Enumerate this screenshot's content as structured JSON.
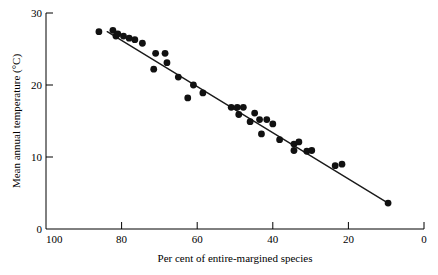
{
  "chart_data": {
    "type": "scatter",
    "title": "",
    "xlabel": "Per cent of entire-margined species",
    "ylabel": "Mean annual temperature (°C)",
    "xlim": [
      100,
      0
    ],
    "ylim": [
      0,
      30
    ],
    "x_reversed": true,
    "grid": false,
    "legend": false,
    "xticks": [
      100,
      80,
      60,
      40,
      20,
      0
    ],
    "xtick_labels": [
      "100",
      "80",
      "60",
      "40",
      "20",
      "0"
    ],
    "yticks": [
      0,
      10,
      20,
      30
    ],
    "ytick_labels": [
      "0",
      "10",
      "20",
      "30"
    ],
    "series": [
      {
        "name": "sites",
        "marker": "filled-circle",
        "color": "#111111",
        "points": [
          [
            86.0,
            27.4
          ],
          [
            82.3,
            27.6
          ],
          [
            81.5,
            26.8
          ],
          [
            81.0,
            27.1
          ],
          [
            79.5,
            26.8
          ],
          [
            78.0,
            26.5
          ],
          [
            76.5,
            26.3
          ],
          [
            74.5,
            25.8
          ],
          [
            71.0,
            24.4
          ],
          [
            68.5,
            24.4
          ],
          [
            71.5,
            22.2
          ],
          [
            68.0,
            23.1
          ],
          [
            65.0,
            21.1
          ],
          [
            61.0,
            20.0
          ],
          [
            58.5,
            18.9
          ],
          [
            62.5,
            18.2
          ],
          [
            51.0,
            16.9
          ],
          [
            49.4,
            16.9
          ],
          [
            47.8,
            16.9
          ],
          [
            49.0,
            15.9
          ],
          [
            44.8,
            16.1
          ],
          [
            43.5,
            15.2
          ],
          [
            41.6,
            15.2
          ],
          [
            46.0,
            14.9
          ],
          [
            40.0,
            14.6
          ],
          [
            43.0,
            13.2
          ],
          [
            38.2,
            12.4
          ],
          [
            34.4,
            11.8
          ],
          [
            33.1,
            12.1
          ],
          [
            34.4,
            10.9
          ],
          [
            31.0,
            10.8
          ],
          [
            29.7,
            10.9
          ],
          [
            23.5,
            8.8
          ],
          [
            21.7,
            9.0
          ],
          [
            9.5,
            3.6
          ]
        ]
      }
    ],
    "trend_line": {
      "name": "regression-line",
      "color": "#1a1a1a",
      "start": [
        83.8,
        27.4
      ],
      "end": [
        9.5,
        3.6
      ]
    }
  },
  "axes": {
    "x_axis_name": "x-axis",
    "y_axis_name": "y-axis"
  }
}
